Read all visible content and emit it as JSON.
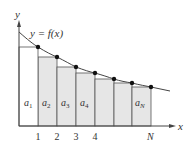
{
  "diagram": {
    "axis_labels": {
      "x": "x",
      "y": "y"
    },
    "curve_label": "y = f(x)",
    "ticks": [
      {
        "label": "1",
        "x": 38
      },
      {
        "label": "2",
        "x": 57
      },
      {
        "label": "3",
        "x": 76
      },
      {
        "label": "4",
        "x": 95
      },
      {
        "label": "N",
        "x": 151
      }
    ],
    "rect_labels": [
      {
        "main": "a",
        "sub": "1"
      },
      {
        "main": "a",
        "sub": "2"
      },
      {
        "main": "a",
        "sub": "3"
      },
      {
        "main": "a",
        "sub": "4"
      },
      {
        "main": "a",
        "sub": "N"
      }
    ],
    "colors": {
      "fill": "#e6e6e6",
      "stroke": "#555555",
      "curve": "#444444",
      "dot": "#111111"
    }
  }
}
